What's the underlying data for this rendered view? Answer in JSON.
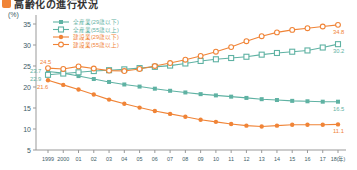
{
  "title": {
    "text": "高齢化の進行状況",
    "bullet_color": "#f08437"
  },
  "chart_data": {
    "type": "line",
    "unit_label": "(%)",
    "ylim": [
      5,
      35
    ],
    "yticks": [
      35,
      30,
      25,
      20,
      15,
      10,
      5
    ],
    "grid": false,
    "legend_position": "top-left-inside",
    "categories": [
      "1999",
      "2000",
      "01",
      "02",
      "03",
      "04",
      "05",
      "06",
      "07",
      "08",
      "09",
      "10",
      "11",
      "12",
      "13",
      "14",
      "15",
      "16",
      "17",
      "18(年)"
    ],
    "series": [
      {
        "name": "全産業(29歳以下)",
        "color": "#5fb2a3",
        "marker": "square-filled",
        "values": [
          23.7,
          23.3,
          22.6,
          21.9,
          21.2,
          20.6,
          20.1,
          19.6,
          19.1,
          18.7,
          18.3,
          18.0,
          17.7,
          17.4,
          17.1,
          16.9,
          16.7,
          16.6,
          16.5,
          16.5
        ]
      },
      {
        "name": "全産業(55歳以上)",
        "color": "#5fb2a3",
        "marker": "square-open",
        "values": [
          22.9,
          23.2,
          23.5,
          23.8,
          24.0,
          24.2,
          24.5,
          24.8,
          25.1,
          25.6,
          26.2,
          26.6,
          26.9,
          27.2,
          27.7,
          28.1,
          28.4,
          28.7,
          29.4,
          30.2
        ]
      },
      {
        "name": "建設業(29歳以下)",
        "color": "#f08437",
        "marker": "circle-filled",
        "values": [
          21.6,
          20.5,
          19.4,
          18.2,
          17.0,
          16.0,
          15.1,
          14.3,
          13.6,
          12.9,
          12.2,
          11.7,
          11.2,
          10.8,
          10.6,
          10.8,
          11.0,
          11.0,
          11.0,
          11.1
        ]
      },
      {
        "name": "建設業(55歳以上)",
        "color": "#f08437",
        "marker": "circle-open",
        "values": [
          24.5,
          24.3,
          24.9,
          24.4,
          23.9,
          23.8,
          24.3,
          25.0,
          25.7,
          26.5,
          27.4,
          28.4,
          29.5,
          30.9,
          32.1,
          33.0,
          33.6,
          34.0,
          34.4,
          34.8
        ]
      }
    ],
    "annotations": [
      {
        "series": 3,
        "index": 0,
        "text": "24.5",
        "dx": -8,
        "dy": -4
      },
      {
        "series": 0,
        "index": 0,
        "text": "23.7",
        "dx": -18,
        "dy": 2
      },
      {
        "series": 1,
        "index": 0,
        "text": "22.9",
        "dx": -18,
        "dy": 6
      },
      {
        "series": 2,
        "index": 0,
        "text": "21.6",
        "dx": -11,
        "dy": 9
      },
      {
        "series": 3,
        "index": 19,
        "text": "34.8",
        "dx": -5,
        "dy": 9
      },
      {
        "series": 1,
        "index": 19,
        "text": "30.2",
        "dx": -5,
        "dy": 9
      },
      {
        "series": 0,
        "index": 19,
        "text": "16.5",
        "dx": -5,
        "dy": 9
      },
      {
        "series": 2,
        "index": 19,
        "text": "11.1",
        "dx": -5,
        "dy": 9
      }
    ]
  }
}
